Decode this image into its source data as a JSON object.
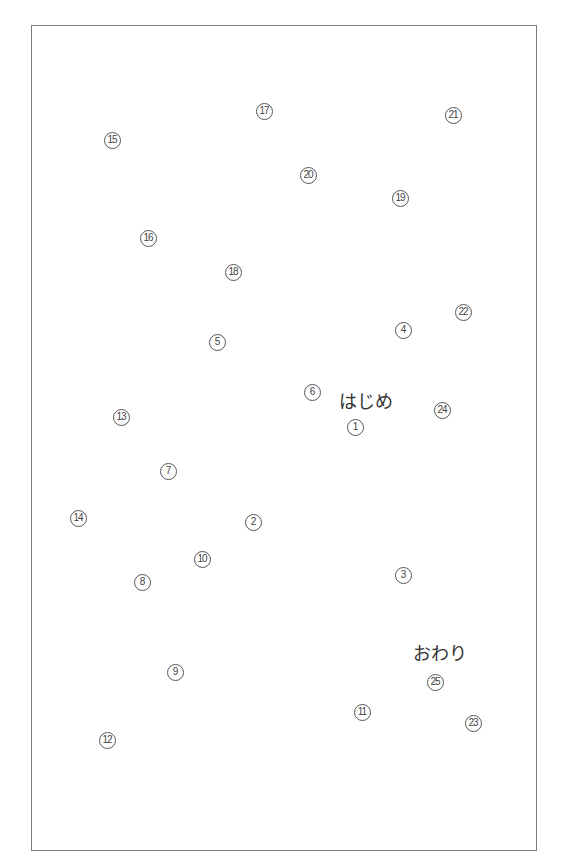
{
  "puzzle": {
    "start_label": "はじめ",
    "end_label": "おわり",
    "start_pos": {
      "x": 366,
      "y": 400
    },
    "end_pos": {
      "x": 440,
      "y": 652
    },
    "points": [
      {
        "n": "1",
        "x": 355,
        "y": 427
      },
      {
        "n": "2",
        "x": 253,
        "y": 522
      },
      {
        "n": "3",
        "x": 403,
        "y": 575
      },
      {
        "n": "4",
        "x": 403,
        "y": 330
      },
      {
        "n": "5",
        "x": 217,
        "y": 342
      },
      {
        "n": "6",
        "x": 312,
        "y": 392
      },
      {
        "n": "7",
        "x": 168,
        "y": 471
      },
      {
        "n": "8",
        "x": 142,
        "y": 582
      },
      {
        "n": "9",
        "x": 175,
        "y": 672
      },
      {
        "n": "10",
        "x": 202,
        "y": 559
      },
      {
        "n": "11",
        "x": 362,
        "y": 712
      },
      {
        "n": "12",
        "x": 107,
        "y": 740
      },
      {
        "n": "13",
        "x": 121,
        "y": 417
      },
      {
        "n": "14",
        "x": 78,
        "y": 518
      },
      {
        "n": "15",
        "x": 112,
        "y": 140
      },
      {
        "n": "16",
        "x": 148,
        "y": 238
      },
      {
        "n": "17",
        "x": 264,
        "y": 111
      },
      {
        "n": "18",
        "x": 233,
        "y": 272
      },
      {
        "n": "19",
        "x": 400,
        "y": 198
      },
      {
        "n": "20",
        "x": 308,
        "y": 175
      },
      {
        "n": "21",
        "x": 453,
        "y": 115
      },
      {
        "n": "22",
        "x": 463,
        "y": 312
      },
      {
        "n": "23",
        "x": 473,
        "y": 723
      },
      {
        "n": "24",
        "x": 442,
        "y": 410
      },
      {
        "n": "25",
        "x": 435,
        "y": 682
      }
    ]
  }
}
